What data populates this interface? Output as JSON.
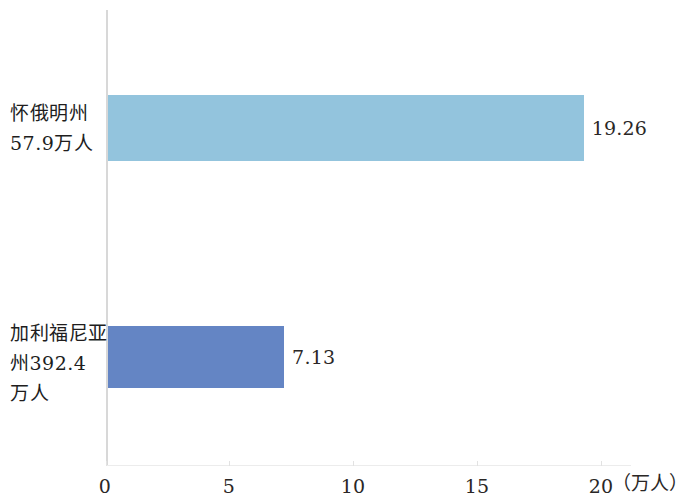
{
  "chart_data": {
    "type": "bar",
    "orientation": "horizontal",
    "title": "",
    "xlabel": "（万人）",
    "ylabel": "",
    "xlim": [
      0,
      20
    ],
    "xticks": [
      0,
      5,
      10,
      15,
      20
    ],
    "xtick_labels": [
      "0",
      "5",
      "10",
      "15",
      "20"
    ],
    "grid": false,
    "legend": false,
    "categories": [
      "怀俄明州57.9万人",
      "加利福尼亚州392.4万人"
    ],
    "category_label_lines": [
      [
        "怀俄明州",
        "57.9万人"
      ],
      [
        "加利福尼亚",
        "州392.4",
        "万人"
      ]
    ],
    "values": [
      19.26,
      7.13
    ],
    "value_labels": [
      "19.26",
      "7.13"
    ],
    "colors": [
      "#93c4dd",
      "#6485c4"
    ],
    "axis_color": "#d8d8d8",
    "background": "#ffffff"
  }
}
